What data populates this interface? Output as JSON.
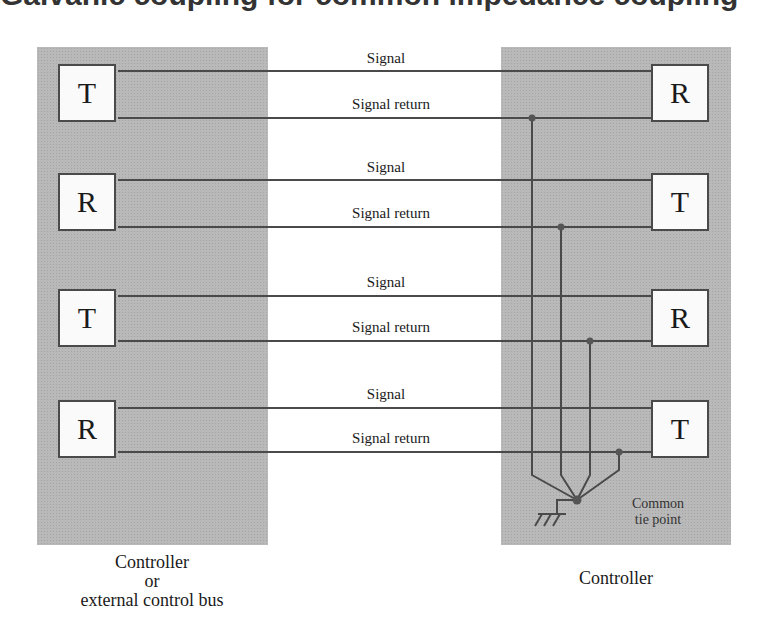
{
  "header": {
    "partial_title": "Galvanic coupling for common impedance coupling"
  },
  "colors": {
    "panel": "#b9b9b9",
    "wire": "#4a4a4a",
    "box_fill": "#fafafa"
  },
  "left_panel": {
    "caption_lines": [
      "Controller",
      "or",
      "external control bus"
    ],
    "boxes": [
      "T",
      "R",
      "T",
      "R"
    ]
  },
  "right_panel": {
    "caption": "Controller",
    "boxes": [
      "R",
      "T",
      "R",
      "T"
    ],
    "tie_point_label": [
      "Common",
      "tie point"
    ],
    "ground_symbol": "chassis-ground-icon"
  },
  "wire_pairs": [
    {
      "signal": "Signal",
      "return": "Signal return"
    },
    {
      "signal": "Signal",
      "return": "Signal return"
    },
    {
      "signal": "Signal",
      "return": "Signal return"
    },
    {
      "signal": "Signal",
      "return": "Signal return"
    }
  ]
}
